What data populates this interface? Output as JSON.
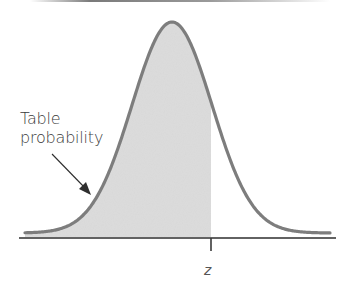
{
  "figure": {
    "callout_line1": "Table",
    "callout_line2": "probability",
    "z_label": "z",
    "colors": {
      "curve": "#7d7d7d",
      "shade": "#dcdcdc",
      "axis": "#2e2e2e",
      "arrow": "#2e2e2e",
      "text": "#3a3a3a"
    },
    "curve": {
      "type": "normal-density",
      "shaded_region": "left of z",
      "peak_x_px": 172,
      "z_x_px": 211
    }
  }
}
